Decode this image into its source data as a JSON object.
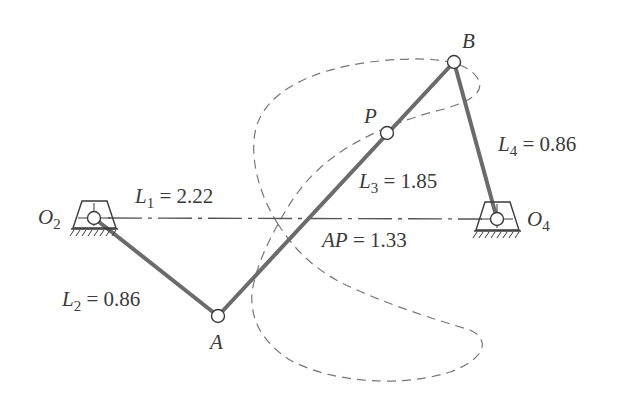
{
  "diagram": {
    "type": "four-bar linkage with coupler curve",
    "colors": {
      "link": "#6b6b6b",
      "ground_line": "#555555",
      "curve": "#777777",
      "joint_fill": "#ffffff",
      "joint_stroke": "#3a3a3a",
      "text": "#3a3a3a"
    },
    "points": {
      "O2": {
        "label": "O",
        "sub": "2",
        "x": 94,
        "y": 218
      },
      "O4": {
        "label": "O",
        "sub": "4",
        "x": 497,
        "y": 219
      },
      "A": {
        "label": "A",
        "x": 218,
        "y": 316
      },
      "B": {
        "label": "B",
        "x": 454,
        "y": 62
      },
      "P": {
        "label": "P",
        "x": 387,
        "y": 133
      }
    },
    "dimensions": {
      "L1": {
        "name": "L",
        "sub": "1",
        "eq": "=",
        "value": "2.22"
      },
      "L2": {
        "name": "L",
        "sub": "2",
        "eq": "=",
        "value": "0.86"
      },
      "L3": {
        "name": "L",
        "sub": "3",
        "eq": "=",
        "value": "1.85"
      },
      "L4": {
        "name": "L",
        "sub": "4",
        "eq": "=",
        "value": "0.86"
      },
      "AP": {
        "name": "AP",
        "eq": "=",
        "value": "1.33"
      }
    }
  }
}
